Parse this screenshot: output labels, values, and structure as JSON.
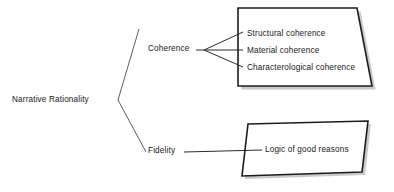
{
  "diagram": {
    "title": "Narrative Rationality",
    "type": "tree-diagram",
    "background_color": "#ffffff",
    "line_color": "#2b2b2b",
    "shape_border_color": "#1a1a1a",
    "shape_fill_color": "#ffffff",
    "shadow_color": "#bdbdbd",
    "root": {
      "label": "Narrative Rationality"
    },
    "branches": [
      {
        "label": "Coherence",
        "items": [
          {
            "label": "Structural coherence"
          },
          {
            "label": "Material coherence"
          },
          {
            "label": "Characterological coherence"
          }
        ]
      },
      {
        "label": "Fidelity",
        "items": [
          {
            "label": "Logic of good reasons"
          }
        ]
      }
    ]
  }
}
